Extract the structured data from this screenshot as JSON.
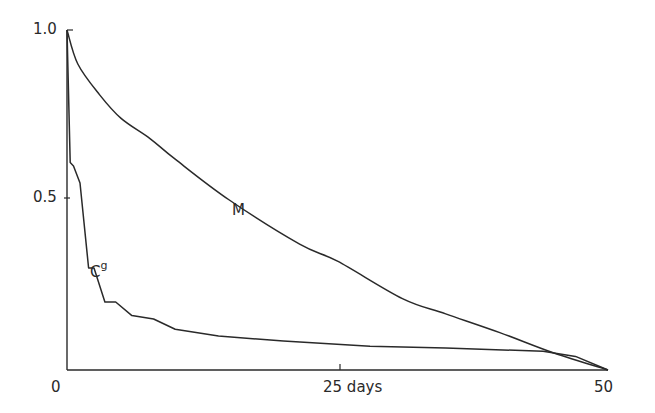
{
  "chart_data": {
    "type": "line",
    "title": "",
    "xlabel": "days",
    "ylabel": "",
    "xlim": [
      0,
      50
    ],
    "ylim": [
      0,
      1.0
    ],
    "x_ticks": [
      "0",
      "25 days",
      "50"
    ],
    "y_ticks": [
      "1.0",
      "0.5"
    ],
    "grid": false,
    "legend": "inline labels",
    "series": [
      {
        "name": "M",
        "x": [
          0,
          1,
          3,
          5,
          7.7,
          10,
          15,
          21.5,
          25,
          31,
          35,
          40,
          45,
          50
        ],
        "values": [
          1.0,
          0.9,
          0.81,
          0.74,
          0.68,
          0.62,
          0.5,
          0.37,
          0.32,
          0.21,
          0.165,
          0.11,
          0.05,
          0.0
        ]
      },
      {
        "name": "Cg",
        "x": [
          0,
          0.3,
          0.6,
          1.2,
          2.0,
          2.5,
          3.5,
          4.5,
          6,
          8,
          10,
          14,
          20,
          28,
          35,
          44,
          47,
          50
        ],
        "values": [
          1.0,
          0.61,
          0.6,
          0.55,
          0.3,
          0.3,
          0.2,
          0.2,
          0.16,
          0.15,
          0.12,
          0.1,
          0.085,
          0.07,
          0.065,
          0.055,
          0.04,
          0.0
        ]
      }
    ]
  },
  "labels": {
    "y_top": "1.0",
    "y_mid": "0.5",
    "x_origin": "0",
    "x_mid": "25 days",
    "x_end": "50",
    "curve_m": "M",
    "curve_cg_base": "C",
    "curve_cg_sup": "g"
  },
  "layout": {
    "origin_px": [
      67,
      370
    ],
    "x_end_px": 608,
    "y_top_px": 30,
    "line_color": "#2a2a2a"
  }
}
